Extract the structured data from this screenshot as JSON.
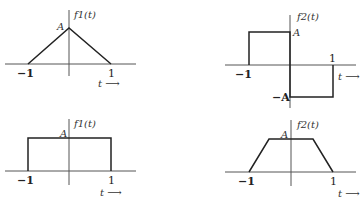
{
  "panels": [
    {
      "id": "top-left",
      "function_label": "f1(t)",
      "shape": "triangle",
      "amplitude_label": "A",
      "x_ticks": [
        "−1",
        "1"
      ],
      "axis_label": "t ⟶"
    },
    {
      "id": "top-right",
      "function_label": "f2(t)",
      "shape": "odd-square-pulse",
      "amplitude_label": "A",
      "neg_amplitude_label": "−A",
      "x_ticks": [
        "−1",
        "1"
      ],
      "axis_label": "t ⟶"
    },
    {
      "id": "bottom-left",
      "function_label": "f1(t)",
      "shape": "rectangle",
      "amplitude_label": "A",
      "x_ticks": [
        "−1",
        "1"
      ],
      "axis_label": "t ⟶"
    },
    {
      "id": "bottom-right",
      "function_label": "f2(t)",
      "shape": "trapezoid",
      "amplitude_label": "A",
      "x_ticks": [
        "−1",
        "1"
      ],
      "axis_label": "t ⟶"
    }
  ],
  "colors": {
    "line": "#222222",
    "axis": "#555555",
    "background": "#ffffff"
  }
}
